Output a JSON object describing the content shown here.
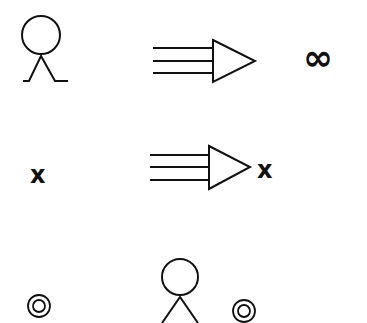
{
  "diagram": {
    "row1": {
      "symbol": "stick-figure",
      "arrow": "triple-line-arrow",
      "result": "∞"
    },
    "row2": {
      "input": "x",
      "arrow": "triple-line-arrow",
      "result": "x"
    },
    "row3": {
      "left": "◎",
      "figure": "stick-figure",
      "right": "◎"
    }
  },
  "colors": {
    "stroke": "#111111",
    "background": "#ffffff"
  }
}
